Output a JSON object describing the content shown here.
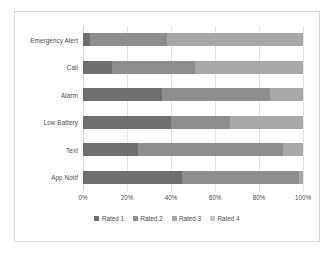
{
  "chart_data": {
    "type": "bar",
    "subtype": "100% stacked horizontal bar",
    "title": "",
    "xlabel": "",
    "ylabel": "",
    "xlim": [
      0,
      100
    ],
    "xticks": [
      "0%",
      "20%",
      "40%",
      "60%",
      "80%",
      "100%"
    ],
    "xtick_values": [
      0,
      20,
      40,
      60,
      80,
      100
    ],
    "grid": true,
    "grid_axis": "x",
    "legend_position": "bottom",
    "categories": [
      "Emergency Alert",
      "Call",
      "Alarm",
      "Low Battery",
      "Text",
      "App Notif"
    ],
    "series": [
      {
        "name": "Rated 1",
        "color": "#6f6f6f",
        "values": [
          3,
          13,
          36,
          40,
          25,
          45
        ]
      },
      {
        "name": "Rated 2",
        "color": "#8e8e8e",
        "values": [
          35,
          38,
          49,
          27,
          66,
          53
        ]
      },
      {
        "name": "Rated 3",
        "color": "#a8a8a8",
        "values": [
          62,
          49,
          15,
          33,
          9,
          2
        ]
      },
      {
        "name": "Rated 4",
        "color": "#c6c6c6",
        "values": [
          0,
          0,
          0,
          0,
          0,
          0
        ]
      }
    ],
    "colors": {
      "series1": "#6f6f6f",
      "series2": "#8e8e8e",
      "series3": "#a8a8a8",
      "series4": "#c6c6c6",
      "gridline": "#e4e4e4",
      "border": "#d9d9d9",
      "text": "#4b4b4b",
      "background": "#ffffff"
    }
  }
}
